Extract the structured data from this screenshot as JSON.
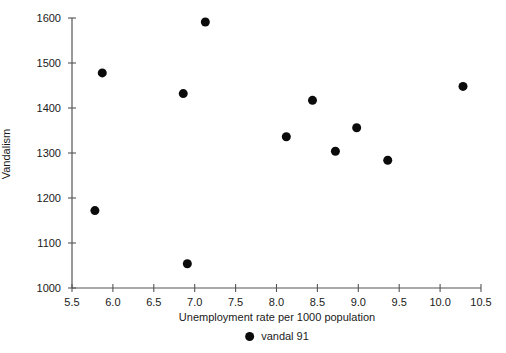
{
  "chart_data": {
    "type": "scatter",
    "title": "",
    "xlabel": "Unemployment rate per 1000 population",
    "ylabel": "Vandalism",
    "xlim": [
      5.5,
      10.5
    ],
    "ylim": [
      1000,
      1600
    ],
    "xticks": [
      5.5,
      6.0,
      6.5,
      7.0,
      7.5,
      8.0,
      8.5,
      9.0,
      9.5,
      10.0,
      10.5
    ],
    "xticklabels": [
      "5.5",
      "6.0",
      "6.5",
      "7.0",
      "7.5",
      "8.0",
      "8.5",
      "9.0",
      "9.5",
      "10.0",
      "10.5"
    ],
    "yticks": [
      1000,
      1100,
      1200,
      1300,
      1400,
      1500,
      1600
    ],
    "yticklabels": [
      "1000",
      "1100",
      "1200",
      "1300",
      "1400",
      "1500",
      "1600"
    ],
    "grid": false,
    "legend_position": "below-axis",
    "series": [
      {
        "name": "vandal 91",
        "marker": "filled-circle",
        "color": "#0b0b0b",
        "marker_size": 9,
        "points": [
          {
            "x": 5.78,
            "y": 1172
          },
          {
            "x": 5.87,
            "y": 1478
          },
          {
            "x": 6.86,
            "y": 1432
          },
          {
            "x": 6.91,
            "y": 1054
          },
          {
            "x": 7.13,
            "y": 1591
          },
          {
            "x": 8.12,
            "y": 1336
          },
          {
            "x": 8.44,
            "y": 1417
          },
          {
            "x": 8.72,
            "y": 1304
          },
          {
            "x": 8.98,
            "y": 1356
          },
          {
            "x": 9.36,
            "y": 1284
          },
          {
            "x": 10.28,
            "y": 1448
          }
        ]
      }
    ]
  },
  "legend": {
    "entries": [
      {
        "label": "vandal 91",
        "marker": "filled-circle",
        "color": "#0b0b0b"
      }
    ]
  },
  "axes": {
    "x_title": "Unemployment rate per 1000 population",
    "y_title": "Vandalism",
    "axis_color": "#555555"
  }
}
